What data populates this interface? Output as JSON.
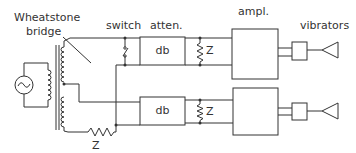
{
  "labels": {
    "bridge_line1": "Wheatstone",
    "bridge_line2": "bridge",
    "switch": "switch",
    "atten": "atten.",
    "ampl": "ampl.",
    "vibrators": "vibrators"
  },
  "components": {
    "atten_top": "db",
    "atten_bottom": "db",
    "z_top": "Z",
    "z_bottom": "Z",
    "z_series": "Z"
  },
  "colors": {
    "line": "#333333",
    "background": "#ffffff"
  }
}
